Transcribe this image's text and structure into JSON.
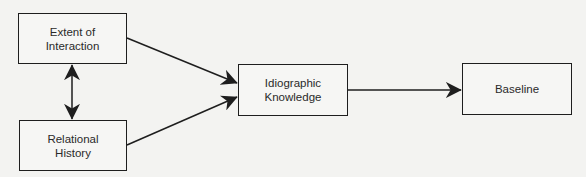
{
  "diagram": {
    "type": "flowchart",
    "colors": {
      "background": "#f3f3f1",
      "stroke": "#1e1e1e",
      "text": "#2a2a2a"
    },
    "nodes": [
      {
        "id": "extent",
        "label": "Extent of\nInteraction",
        "x": 18,
        "y": 13,
        "w": 109,
        "h": 51
      },
      {
        "id": "relational",
        "label": "Relational\nHistory",
        "x": 19,
        "y": 120,
        "w": 108,
        "h": 51
      },
      {
        "id": "idiographic",
        "label": "Idiographic\nKnowledge",
        "x": 238,
        "y": 64,
        "w": 110,
        "h": 52
      },
      {
        "id": "baseline",
        "label": "Baseline",
        "x": 462,
        "y": 63,
        "w": 110,
        "h": 52
      }
    ],
    "edges": [
      {
        "from": "extent",
        "to": "relational",
        "kind": "bidirectional"
      },
      {
        "from": "extent",
        "to": "idiographic",
        "kind": "directed"
      },
      {
        "from": "relational",
        "to": "idiographic",
        "kind": "directed"
      },
      {
        "from": "idiographic",
        "to": "baseline",
        "kind": "directed"
      }
    ]
  }
}
